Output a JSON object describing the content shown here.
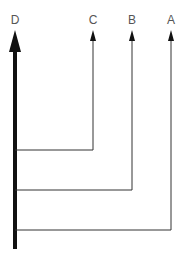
{
  "diagram": {
    "labels": {
      "d": "D",
      "c": "C",
      "b": "B",
      "a": "A"
    },
    "colors": {
      "line": "#333333",
      "main": "#111111",
      "text": "#555555"
    }
  }
}
